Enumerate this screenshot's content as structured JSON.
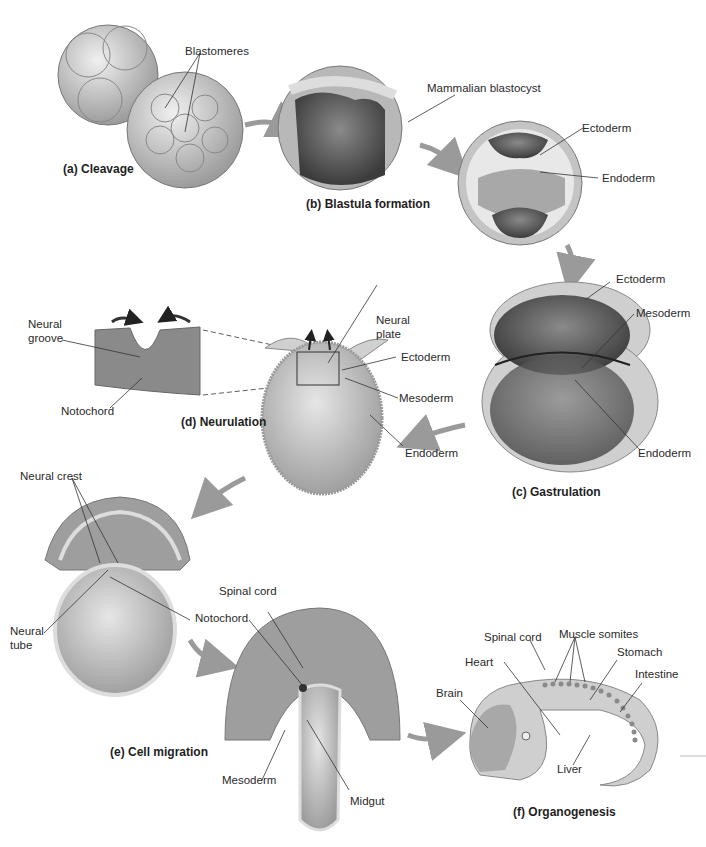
{
  "stages": {
    "a": {
      "caption": "(a) Cleavage",
      "labels": {
        "blastomeres": "Blastomeres"
      }
    },
    "b": {
      "caption": "(b) Blastula formation",
      "labels": {
        "blastocyst": "Mammalian blastocyst",
        "ectoderm": "Ectoderm",
        "endoderm": "Endoderm"
      }
    },
    "c": {
      "caption": "(c) Gastrulation",
      "labels": {
        "ectoderm": "Ectoderm",
        "mesoderm": "Mesoderm",
        "endoderm": "Endoderm"
      }
    },
    "d": {
      "caption": "(d) Neurulation",
      "labels": {
        "neural_groove_1": "Neural",
        "neural_groove_2": "groove",
        "notochord": "Notochord",
        "neural_plate_1": "Neural",
        "neural_plate_2": "plate",
        "ectoderm": "Ectoderm",
        "mesoderm": "Mesoderm",
        "endoderm": "Endoderm"
      }
    },
    "e": {
      "caption": "(e) Cell migration",
      "labels": {
        "neural_crest": "Neural crest",
        "neural_tube_1": "Neural",
        "neural_tube_2": "tube",
        "notochord": "Notochord",
        "spinal_cord": "Spinal cord",
        "mesoderm": "Mesoderm",
        "midgut": "Midgut"
      }
    },
    "f": {
      "caption": "(f) Organogenesis",
      "labels": {
        "spinal_cord": "Spinal cord",
        "muscle_somites": "Muscle somites",
        "stomach": "Stomach",
        "heart": "Heart",
        "intestine": "Intestine",
        "brain": "Brain",
        "liver": "Liver"
      }
    }
  },
  "colors": {
    "tissue": "#c8c8c8",
    "dark": "#555555",
    "arrow": "#9a9a9a"
  }
}
